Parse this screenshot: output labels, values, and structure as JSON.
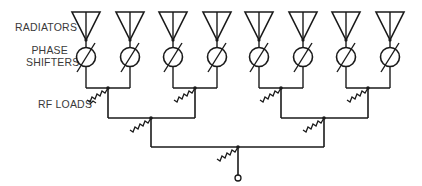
{
  "labels": {
    "radiators": "RADIATORS",
    "phase_shifters_line1": "PHASE",
    "phase_shifters_line2": "SHIFTERS",
    "rf_loads": "RF LOADS"
  },
  "diagram": {
    "type": "corporate-feed phased array",
    "element_count": 8,
    "combiner_levels": 3,
    "stroke_color": "#1a1a1a",
    "text_color": "#3a3a3a"
  }
}
